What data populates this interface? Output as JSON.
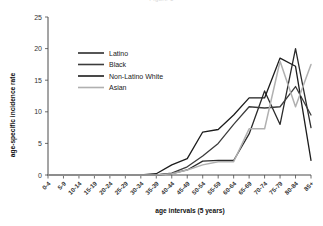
{
  "figure": {
    "faint_title": "Figure 1",
    "background_color": "#ffffff"
  },
  "axes": {
    "x_title": "age intervals (5 years)",
    "y_title": "age-specific incidence rate",
    "y_ticks": [
      "0",
      "5",
      "10",
      "15",
      "20",
      "25"
    ],
    "axis_color": "#4a4a4a"
  },
  "legend": {
    "position": "upper-left-inside",
    "items": [
      {
        "label": "Latino",
        "color": "#2b2b2b"
      },
      {
        "label": "Black",
        "color": "#3c3c3c"
      },
      {
        "label": "Non-Latino White",
        "color": "#1c1c1c"
      },
      {
        "label": "Asian",
        "color": "#b0b0b0"
      }
    ]
  },
  "chart_data": {
    "type": "line",
    "title": "Figure 1",
    "xlabel": "age intervals (5 years)",
    "ylabel": "age-specific incidence rate",
    "ylim": [
      0,
      25
    ],
    "yticks": [
      0,
      5,
      10,
      15,
      20,
      25
    ],
    "grid": false,
    "legend_position": "upper left",
    "categories": [
      "0-4",
      "5-9",
      "10-14",
      "15-19",
      "20-24",
      "25-29",
      "30-34",
      "35-39",
      "40-44",
      "45-49",
      "50-54",
      "55-59",
      "60-64",
      "65-69",
      "70-74",
      "75-79",
      "80-84",
      "85+"
    ],
    "series": [
      {
        "name": "Latino",
        "color": "#2b2b2b",
        "values": [
          0,
          0,
          0,
          0,
          0,
          0,
          0,
          0,
          0.2,
          0.8,
          2.2,
          2.3,
          2.3,
          6.5,
          13.3,
          8.0,
          20.0,
          7.5
        ]
      },
      {
        "name": "Black",
        "color": "#3c3c3c",
        "values": [
          0,
          0,
          0,
          0,
          0,
          0,
          0,
          0,
          0.3,
          1.3,
          3.0,
          5.0,
          8.0,
          10.8,
          10.6,
          10.8,
          14.0,
          9.5
        ]
      },
      {
        "name": "Non-Latino White",
        "color": "#1c1c1c",
        "values": [
          0,
          0,
          0,
          0,
          0,
          0,
          0,
          0.2,
          1.6,
          2.6,
          6.8,
          7.2,
          9.5,
          12.2,
          12.2,
          18.5,
          17.2,
          2.3
        ]
      },
      {
        "name": "Asian",
        "color": "#b0b0b0",
        "values": [
          0,
          0,
          0,
          0,
          0,
          0,
          0,
          0,
          0.2,
          0.8,
          1.6,
          2.1,
          2.1,
          7.3,
          7.3,
          18.0,
          10.8,
          17.5
        ]
      }
    ]
  }
}
